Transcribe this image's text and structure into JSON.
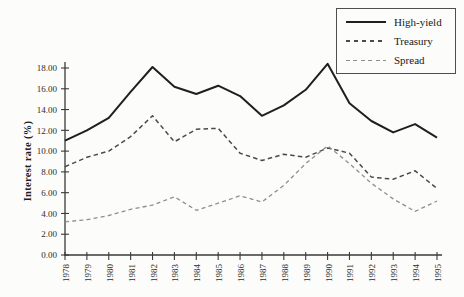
{
  "figure": {
    "y_axis_title": "Interest rate (%)"
  },
  "chart_data": {
    "type": "line",
    "title": "",
    "xlabel": "",
    "ylabel": "Interest rate (%)",
    "ylim": [
      0,
      18
    ],
    "y_tick_step": 2,
    "y_tick_labels": [
      "0.00",
      "2.00",
      "4.00",
      "6.00",
      "8.00",
      "10.00",
      "12.00",
      "14.00",
      "16.00",
      "18.00"
    ],
    "grid": false,
    "legend_position": "top-right",
    "categories": [
      "1978",
      "1979",
      "1980",
      "1981",
      "1982",
      "1983",
      "1984",
      "1985",
      "1986",
      "1987",
      "1988",
      "1989",
      "1990",
      "1991",
      "1992",
      "1993",
      "1994",
      "1995"
    ],
    "series": [
      {
        "name": "High-yield",
        "style": "solid",
        "color": "#1f1f1f",
        "dash": "",
        "width": 2,
        "values": [
          11.0,
          12.0,
          13.2,
          15.7,
          18.1,
          16.2,
          15.5,
          16.3,
          15.3,
          13.4,
          14.4,
          15.9,
          18.4,
          14.6,
          12.9,
          11.8,
          12.6,
          11.3
        ]
      },
      {
        "name": "Treasury",
        "style": "dashed",
        "color": "#4a4a4a",
        "dash": "4.5,3.2",
        "width": 1.5,
        "values": [
          8.5,
          9.4,
          10.0,
          11.4,
          13.4,
          10.9,
          12.1,
          12.2,
          9.8,
          9.1,
          9.7,
          9.4,
          10.3,
          9.8,
          7.5,
          7.3,
          8.1,
          6.4
        ]
      },
      {
        "name": "Spread",
        "style": "dashed-light",
        "color": "#8e8e8e",
        "dash": "4,3.2",
        "width": 1.3,
        "values": [
          3.2,
          3.4,
          3.8,
          4.4,
          4.8,
          5.6,
          4.3,
          5.0,
          5.7,
          5.1,
          6.7,
          8.8,
          10.5,
          8.8,
          6.9,
          5.4,
          4.2,
          5.2
        ]
      }
    ]
  }
}
